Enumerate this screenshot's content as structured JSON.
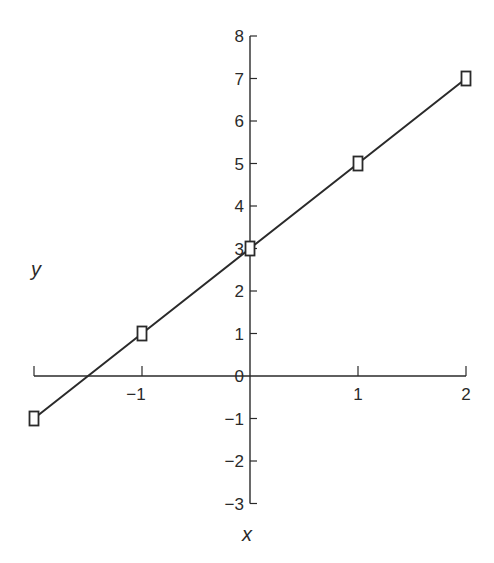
{
  "chart_data": {
    "type": "line",
    "title": "",
    "xlabel": "x",
    "ylabel": "y",
    "x": [
      -2,
      -1,
      0,
      1,
      2
    ],
    "series": [
      {
        "name": "y = 2x + 3",
        "values": [
          -1,
          1,
          3,
          5,
          7
        ],
        "marker": "square",
        "color": "#2a2a2a"
      }
    ],
    "xlim": [
      -2,
      2
    ],
    "ylim": [
      -3,
      8
    ],
    "x_ticks": [
      -1,
      0,
      1,
      2
    ],
    "x_tick_labels": [
      "−1",
      "0",
      "1",
      "2"
    ],
    "y_ticks": [
      -3,
      -2,
      -1,
      0,
      1,
      2,
      3,
      4,
      5,
      6,
      7,
      8
    ],
    "y_tick_labels": [
      "−3",
      "−2",
      "−1",
      "0",
      "1",
      "2",
      "3",
      "4",
      "5",
      "6",
      "7",
      "8"
    ],
    "grid": false,
    "legend": null
  },
  "labels": {
    "x_axis": "x",
    "y_axis": "y"
  },
  "colors": {
    "ink": "#2a2a2a",
    "background": "#ffffff"
  }
}
